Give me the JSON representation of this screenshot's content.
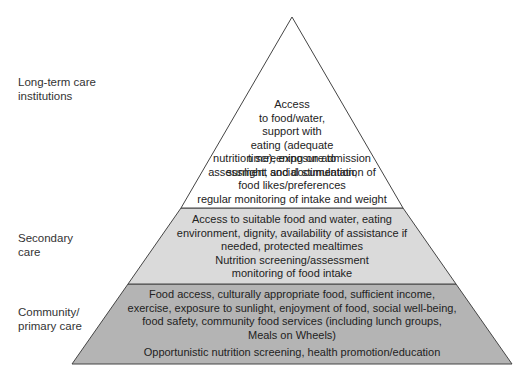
{
  "diagram": {
    "type": "pyramid",
    "colors": {
      "top": "#ffffff",
      "middle": "#dadada",
      "bottom": "#b4b4b4",
      "outline": "#444444"
    },
    "levels": [
      {
        "label": "Long-term care\ninstitutions",
        "text1": "Access\nto food/water,\nsupport with\neating (adequate\ntime), exposure to\nsunlight, social stimulation,",
        "text2": "nutrition screening on admission\nassessment and documentation of\nfood likes/preferences\nregular monitoring of intake and weight"
      },
      {
        "label": "Secondary\ncare",
        "text1": "Access to suitable food and water, eating\nenvironment, dignity, availability of assistance if\nneeded, protected mealtimes\nNutrition screening/assessment\nmonitoring of food intake"
      },
      {
        "label": "Community/\nprimary care",
        "text1": "Food access, culturally appropriate food, sufficient income,\nexercise, exposure to sunlight, enjoyment of food, social well-being,\nfood safety, community food services (including lunch groups,\nMeals on Wheels)",
        "text2": "Opportunistic nutrition screening, health promotion/education"
      }
    ]
  }
}
